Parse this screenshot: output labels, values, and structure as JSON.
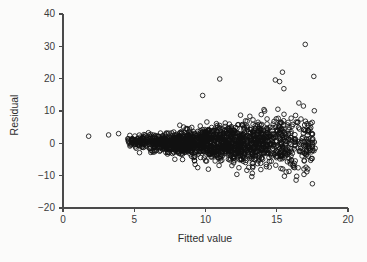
{
  "figure": {
    "background_color": "#fbfbfa",
    "foreground_color": "#111111",
    "axis_color": "#4a4a4a"
  },
  "chart_data": {
    "type": "scatter",
    "title": "",
    "xlabel": "Fitted value",
    "ylabel": "Residual",
    "xlim": [
      0,
      20
    ],
    "ylim": [
      -20,
      40
    ],
    "xticks": [
      0,
      5,
      10,
      15,
      20
    ],
    "xtick_labels": [
      "0",
      "5",
      "10",
      "15",
      "20"
    ],
    "yticks": [
      -20,
      -10,
      0,
      10,
      20,
      30,
      40
    ],
    "ytick_labels": [
      "-20",
      "-10",
      "0",
      "10",
      "20",
      "30",
      "40"
    ],
    "grid": false,
    "legend": null,
    "marker": "open-circle",
    "marker_size": 2.3,
    "n_points": 1700,
    "isolated_points": [
      {
        "x": 1.8,
        "y": 2.2
      },
      {
        "x": 3.2,
        "y": 2.6
      },
      {
        "x": 3.9,
        "y": 3.0
      }
    ],
    "notable_outliers": [
      {
        "x": 17.0,
        "y": 30.6
      },
      {
        "x": 17.6,
        "y": 20.7
      },
      {
        "x": 11.0,
        "y": 19.9
      },
      {
        "x": 15.4,
        "y": 22.0
      },
      {
        "x": 14.9,
        "y": 19.6
      },
      {
        "x": 15.2,
        "y": 19.1
      },
      {
        "x": 15.5,
        "y": 16.9
      },
      {
        "x": 9.8,
        "y": 14.8
      },
      {
        "x": 17.5,
        "y": -12.5
      },
      {
        "x": 16.4,
        "y": -10.2
      },
      {
        "x": 12.2,
        "y": -9.6
      },
      {
        "x": 10.2,
        "y": -8.0
      }
    ],
    "spread_profile": [
      {
        "x": 4.5,
        "sd": 0.9
      },
      {
        "x": 6.0,
        "sd": 1.2
      },
      {
        "x": 8.0,
        "sd": 1.7
      },
      {
        "x": 10.0,
        "sd": 2.3
      },
      {
        "x": 12.0,
        "sd": 3.0
      },
      {
        "x": 14.0,
        "sd": 3.6
      },
      {
        "x": 16.0,
        "sd": 4.4
      },
      {
        "x": 17.6,
        "sd": 5.0
      }
    ],
    "density_profile": [
      {
        "x": 4.5,
        "weight": 0.2
      },
      {
        "x": 6.0,
        "weight": 0.45
      },
      {
        "x": 7.5,
        "weight": 0.8
      },
      {
        "x": 9.0,
        "weight": 1.0
      },
      {
        "x": 10.5,
        "weight": 1.0
      },
      {
        "x": 12.0,
        "weight": 0.95
      },
      {
        "x": 13.5,
        "weight": 0.8
      },
      {
        "x": 15.0,
        "weight": 0.55
      },
      {
        "x": 16.5,
        "weight": 0.35
      },
      {
        "x": 17.7,
        "weight": 0.18
      }
    ],
    "geometry": {
      "x_axis_px": {
        "x0": 63,
        "x20": 348,
        "y": 208
      },
      "y_axis_px": {
        "x": 63,
        "y40": 14,
        "y_minus20": 208
      }
    }
  }
}
